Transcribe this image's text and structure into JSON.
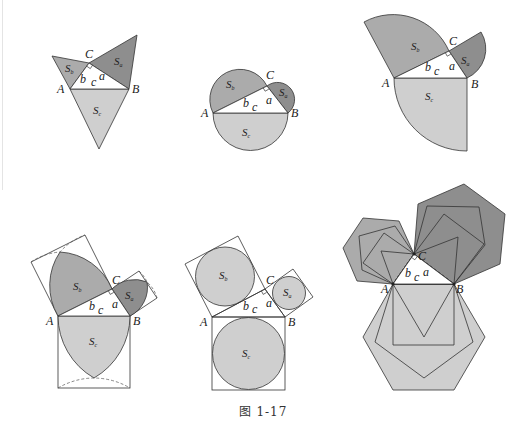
{
  "caption": "图 1-17",
  "colors": {
    "s_a_fill": "#8e8e8e",
    "s_b_fill": "#ababab",
    "s_c_fill": "#cfcfcf",
    "stroke": "#333333",
    "background": "#ffffff"
  },
  "labels": {
    "vertex_a": "A",
    "vertex_b": "B",
    "vertex_c": "C",
    "side_a": "a",
    "side_b": "b",
    "side_c": "c",
    "area_base": "S",
    "sub_a": "a",
    "sub_b": "b",
    "sub_c": "c"
  },
  "figures": [
    {
      "id": "equilateral-triangles",
      "shape": "equilateral triangle on each side"
    },
    {
      "id": "semicircles",
      "shape": "semicircle on each side"
    },
    {
      "id": "quarter-circles",
      "shape": "quarter circle on each side"
    },
    {
      "id": "lens-in-squares",
      "shape": "lens (two arcs) inscribed in square on each side"
    },
    {
      "id": "circles-in-squares",
      "shape": "inscribed circle in square on each side"
    },
    {
      "id": "nested-polygons",
      "shape": "triangle, square, pentagon, hexagon on each side"
    }
  ]
}
